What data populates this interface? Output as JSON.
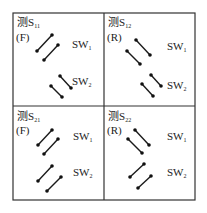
{
  "diagram": {
    "frame": {
      "left": 13,
      "top": 13,
      "right": 195,
      "bottom": 200,
      "divider_x": 104,
      "divider_y": 106,
      "color": "#333333"
    },
    "panels": [
      {
        "id": "s11",
        "measure_prefix": "测S",
        "measure_sub": "11",
        "direction": "(F)",
        "sw1_label": "SW",
        "sw1_sub": "1",
        "sw2_label": "SW",
        "sw2_sub": "2"
      },
      {
        "id": "s12",
        "measure_prefix": "测S",
        "measure_sub": "12",
        "direction": "(R)",
        "sw1_label": "SW",
        "sw1_sub": "1",
        "sw2_label": "SW",
        "sw2_sub": "2"
      },
      {
        "id": "s21",
        "measure_prefix": "测S",
        "measure_sub": "21",
        "direction": "(F)",
        "sw1_label": "SW",
        "sw1_sub": "1",
        "sw2_label": "SW",
        "sw2_sub": "2"
      },
      {
        "id": "s22",
        "measure_prefix": "测S",
        "measure_sub": "22",
        "direction": "(R)",
        "sw1_label": "SW",
        "sw1_sub": "1",
        "sw2_label": "SW",
        "sw2_sub": "2"
      }
    ],
    "switch_orientation": {
      "s11": {
        "sw1": "forward-slash",
        "sw2": "back-slash"
      },
      "s12": {
        "sw1": "back-slash",
        "sw2": "back-slash"
      },
      "s21": {
        "sw1": "forward-slash",
        "sw2": "forward-slash"
      },
      "s22": {
        "sw1": "back-slash",
        "sw2": "forward-slash"
      }
    }
  }
}
